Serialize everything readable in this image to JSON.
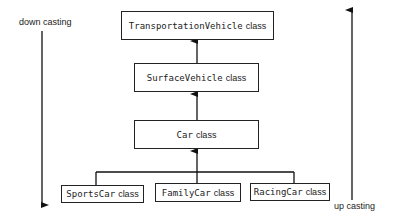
{
  "diagram": {
    "nodes": [
      {
        "id": "transportation",
        "name": "TransportationVehicle",
        "suffix": "class"
      },
      {
        "id": "surface",
        "name": "SurfaceVehicle",
        "suffix": "class"
      },
      {
        "id": "car",
        "name": "Car",
        "suffix": "class"
      },
      {
        "id": "sportscar",
        "name": "SportsCar",
        "suffix": "class"
      },
      {
        "id": "familycar",
        "name": "FamilyCar",
        "suffix": "class"
      },
      {
        "id": "racingcar",
        "name": "RacingCar",
        "suffix": "class"
      }
    ],
    "edges": [
      {
        "from": "surface",
        "to": "transportation"
      },
      {
        "from": "car",
        "to": "surface"
      },
      {
        "from": "sportscar",
        "to": "car"
      },
      {
        "from": "familycar",
        "to": "car"
      },
      {
        "from": "racingcar",
        "to": "car"
      }
    ],
    "left_label": "down casting",
    "right_label": "up casting"
  }
}
